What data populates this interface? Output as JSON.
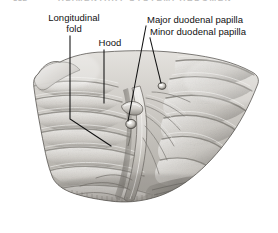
{
  "page": {
    "folio": "332",
    "running_head": "ALIMENTARY SYSTEM: ABDOMEN",
    "background_color": "#ffffff",
    "text_color": "#111111"
  },
  "figure": {
    "caption_visible": false,
    "rendering": "grayscale halftone anatomical illustration",
    "labels": [
      {
        "id": "longitudinal-fold",
        "text_line_1": "Longitudinal",
        "text_line_2": "fold",
        "full_text": "Longitudinal fold",
        "leader": "vertical line descending to an angled bracket pointing at the longitudinal fold"
      },
      {
        "id": "hood",
        "text_line_1": "Hood",
        "text_line_2": "",
        "full_text": "Hood",
        "leader": "vertical line descending to the hood above the major papilla"
      },
      {
        "id": "major-duodenal-papilla",
        "text_line_1": "Major duodenal papilla",
        "text_line_2": "",
        "full_text": "Major duodenal papilla",
        "leader": "diagonal line descending left to the major papilla"
      },
      {
        "id": "minor-duodenal-papilla",
        "text_line_1": "Minor duodenal papilla",
        "text_line_2": "",
        "full_text": "Minor duodenal papilla",
        "leader": "diagonal line descending left to the minor papilla"
      }
    ],
    "leader_color": "#111111",
    "illustration_tones": {
      "highlight": "#f2f1ef",
      "light": "#d8d6d2",
      "mid": "#b4b1ab",
      "shadow": "#8d8a84",
      "deep_shadow": "#5f5d58",
      "outline": "#4a4843"
    }
  }
}
